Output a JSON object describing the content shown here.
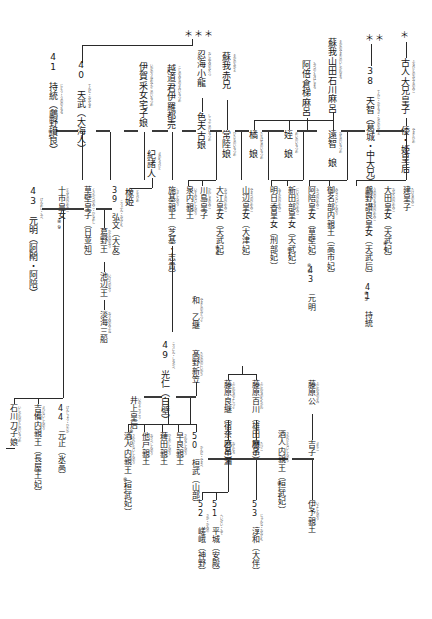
{
  "chart": {
    "type": "genealogy-tree",
    "orientation": "vertical-japanese",
    "markers": {
      "triple_star": "＊＊＊",
      "double_star": "＊＊",
      "single_star": "＊"
    }
  },
  "nodes": {
    "furuhito": {
      "label": "古人大兄皇子",
      "ruby": "ふるひとのおおえのみこ"
    },
    "yamato_hime": {
      "label": "倭・姫皇后",
      "ruby": "やまとひめ"
    },
    "tenji": {
      "label": "38 天智（葛城・中大兄）",
      "ruby": "てんじ・かずらき・なかのおおえ"
    },
    "soga_yamada": {
      "label": "蘇我山田石川麻呂",
      "ruby": "そがのやまだのいしかわまろ"
    },
    "ochi_no_iratsume": {
      "label": "遠智　娘",
      "ruby": "おちのいらつめ"
    },
    "mei_no_iratsume": {
      "label": "姪　娘",
      "ruby": "めいのいらつめ"
    },
    "abe_kurahashimaro": {
      "label": "阿倍倉梯麻呂",
      "ruby": "あべのくらはしまろ"
    },
    "tachibana_no_iratsume": {
      "label": "橘　娘",
      "ruby": "たちばなのいらつめ"
    },
    "soga_akae": {
      "label": "蘇我赤兄",
      "ruby": "そがのあかえ"
    },
    "hitachi_no_iratsume": {
      "label": "常陸娘",
      "ruby": "ひたちのいらつめ"
    },
    "oshiumi_no_oda": {
      "label": "忍海小龍",
      "ruby": "おしぬみのおたつ"
    },
    "shikibuko_no_iratsume": {
      "label": "色夫古娘",
      "ruby": "しこぶこのいらつめ"
    },
    "temmu": {
      "label": "40 天武（大海人）",
      "ruby": "てんむ・おおあま"
    },
    "jito": {
      "label": "41 持統（鸕野讃良）",
      "ruby": "じとう・うののさらら"
    },
    "ochi_kimi_irahime": {
      "label": "越道君伊羅都売",
      "ruby": "こしのみちのきみいらつめ"
    },
    "iga_uneme_yakako": {
      "label": "伊賀采女宅子娘",
      "ruby": "いがのうねめやかこのいらつめ"
    },
    "ki_no_morohito": {
      "label": "紀諸人",
      "ruby": "きのもろひと"
    },
    "tochi_hime": {
      "label": "橡姫",
      "ruby": "とちひめ"
    },
    "kobun": {
      "label": "39 弘文（大友）",
      "ruby": "こうぶん・おおとも"
    },
    "toochi_himemiko": {
      "label": "十市皇女",
      "ruby": "とおちのひめみこ"
    },
    "kusakabe": {
      "label": "草壁皇子（日並知）",
      "ruby": "くさかべのみこ・ひなめし"
    },
    "gemmei": {
      "label": "43 元明（阿閇・阿陪）",
      "ruby": "げんめい・あへ"
    },
    "katsuragi_o": {
      "label": "葛野王",
      "ruby": "かどののおう"
    },
    "ikebe_o": {
      "label": "池辺王",
      "ruby": "いけべのおう"
    },
    "awata_mifune": {
      "label": "淡海三船",
      "ruby": "おうみのみふね"
    },
    "shiki_shinno": {
      "label": "施基親王（芝基・志貴）",
      "ruby": "しきしんのう"
    },
    "izumi_shinno": {
      "label": "泉内親王",
      "ruby": "いずみないしんのう"
    },
    "kawashima": {
      "label": "川島皇子",
      "ruby": "かわしまのみこ"
    },
    "oe_himemiko": {
      "label": "大江皇女（天武妃）",
      "ruby": "おおえのひめみこ"
    },
    "yamabe_himemiko": {
      "label": "山辺皇女（大津妃）",
      "ruby": "やまべのひめみこ"
    },
    "asuka_himemiko": {
      "label": "明日香皇女（刑部妃）",
      "ruby": "あすかのひめみこ"
    },
    "nitabe_himemiko": {
      "label": "新田部皇女（天武妃）",
      "ruby": "にいたべのひめみこ"
    },
    "abe_himemiko": {
      "label": "阿陪皇女（草壁妃）　43 元明",
      "ruby": "あへのひめみこ"
    },
    "ana_no_be": {
      "label": "御名部内親王（高市妃）",
      "ruby": "みなべないしんのう"
    },
    "uno_sarara": {
      "label": "鸕野讃良皇女（天武后）　41 持統",
      "ruby": "うののさららのひめみこ"
    },
    "ota_himemiko": {
      "label": "大田皇女（天武妃）",
      "ruby": "おおたのひめみこ"
    },
    "takeru_miko": {
      "label": "建皇子",
      "ruby": "たけるのみこ"
    },
    "konin": {
      "label": "49 光仁（白壁）",
      "ruby": "こうにん・しらかべ"
    },
    "inoue_kogo": {
      "label": "井上皇后",
      "ruby": "いのえこうごう"
    },
    "takano_niigasa": {
      "label": "髙野新笠",
      "ruby": "たかののにいがさ"
    },
    "yamato_otogi": {
      "label": "和　乙継",
      "ruby": "やまとのおとつぐ"
    },
    "kammu": {
      "label": "50 桓武（山部）",
      "ruby": "かんむ・やまべ"
    },
    "sawara": {
      "label": "早良親王",
      "ruby": "さわらしんのう"
    },
    "nota_shinno": {
      "label": "薭田親王",
      "ruby": "ひえだしんのう"
    },
    "osabe": {
      "label": "他戸親王",
      "ruby": "おさべしんのう"
    },
    "sakahito": {
      "label": "酒人内親王（桓武妃）",
      "ruby": "さかひとないしんのう"
    },
    "fujiwara_momokawa": {
      "label": "藤原百川（雄田麻呂）",
      "ruby": "ふじわらのももかわ"
    },
    "fujiwara_yoshitsugu": {
      "label": "藤原良継（宿奈麻呂）",
      "ruby": "ふじわらのよしつぐ"
    },
    "otomuro": {
      "label": "乙牟漏",
      "ruby": "おとむろ"
    },
    "tabiko": {
      "label": "旅子",
      "ruby": "たびこ"
    },
    "fujiwara_k": {
      "label": "藤原公",
      "ruby": "ふじわらのきみ"
    },
    "kichiko": {
      "label": "吉子",
      "ruby": "きちこ"
    },
    "saga": {
      "label": "52 嵯峨（神野）",
      "ruby": "さが・かみの"
    },
    "heizei": {
      "label": "51 平城（安殿）",
      "ruby": "へいぜい・あて"
    },
    "junna": {
      "label": "53 淳和（大伴）",
      "ruby": "じゅんな・おおとも"
    },
    "iyo_shinno": {
      "label": "伊予親王",
      "ruby": "いよしんのう"
    },
    "kammu_44": {
      "label": "44 元正（氷高）",
      "ruby": "げんしょう・ひだか"
    },
    "kibi_naishinno": {
      "label": "吉備内親王（長屋王妃）",
      "ruby": "きびないしんのう"
    },
    "ishikawa_toshiko": {
      "label": "石川刀子娘",
      "ruby": "いしかわのとじのいらつめ"
    }
  },
  "footnotes": {
    "f4": "※4",
    "f5": "※5",
    "f6": "※6",
    "f7": "※7",
    "f8": "※8",
    "f9": "※9",
    "f10": "※10",
    "f12": "※12"
  }
}
